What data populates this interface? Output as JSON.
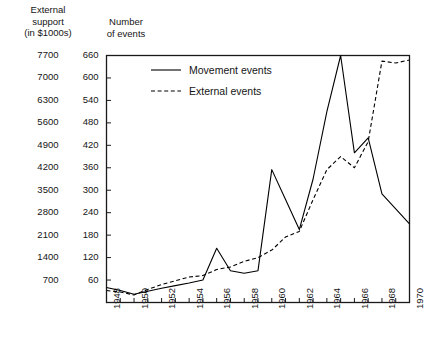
{
  "header": {
    "left_axis_title": "External support\n(in $1000s)",
    "left_axis_title_lines": [
      "External",
      "support",
      "(in $1000s)"
    ],
    "right_axis_title_lines": [
      "Number",
      "of events"
    ]
  },
  "chart_data": {
    "type": "line",
    "title": "",
    "xlabel": "",
    "ylabel": "Number of events",
    "y2label": "External support (in $1000s)",
    "grid": false,
    "legend_position": "top-left-inside",
    "xlim": [
      1948,
      1970
    ],
    "ylim": [
      0,
      660
    ],
    "y2lim": [
      0,
      7700
    ],
    "x": [
      1948,
      1949,
      1950,
      1951,
      1952,
      1953,
      1954,
      1955,
      1956,
      1957,
      1958,
      1959,
      1960,
      1961,
      1962,
      1963,
      1964,
      1965,
      1966,
      1967,
      1968,
      1969,
      1970
    ],
    "xticks": [
      1948,
      1949,
      1950,
      1951,
      1952,
      1953,
      1954,
      1955,
      1956,
      1957,
      1958,
      1959,
      1960,
      1961,
      1962,
      1963,
      1964,
      1965,
      1966,
      1967,
      1968,
      1969,
      1970
    ],
    "xticklabels": [
      "1948",
      "",
      "1950",
      "",
      "1952",
      "",
      "1954",
      "",
      "1956",
      "",
      "1958",
      "",
      "1960",
      "",
      "1962",
      "",
      "1964",
      "",
      "1966",
      "",
      "1968",
      "",
      "1970"
    ],
    "yticks": [
      60,
      120,
      180,
      240,
      300,
      360,
      420,
      480,
      540,
      600,
      660
    ],
    "yticklabels": [
      "60",
      "120",
      "180",
      "240",
      "300",
      "360",
      "420",
      "480",
      "540",
      "600",
      "660"
    ],
    "y2ticks": [
      700,
      1400,
      2100,
      2800,
      3500,
      4200,
      4900,
      5600,
      6300,
      7000,
      7700
    ],
    "y2ticklabels": [
      "700",
      "1400",
      "2100",
      "2800",
      "3500",
      "4200",
      "4900",
      "5600",
      "6300",
      "7000",
      "7700"
    ],
    "series": [
      {
        "name": "Movement events",
        "style": "solid",
        "color": "#000000",
        "values": [
          40,
          32,
          22,
          30,
          38,
          45,
          52,
          60,
          145,
          85,
          78,
          85,
          355,
          275,
          195,
          330,
          510,
          660,
          400,
          440,
          290,
          250,
          210
        ]
      },
      {
        "name": "External events",
        "style": "dashed",
        "color": "#000000",
        "values": [
          32,
          28,
          20,
          35,
          48,
          58,
          68,
          72,
          88,
          95,
          110,
          120,
          140,
          175,
          190,
          275,
          355,
          390,
          360,
          430,
          645,
          640,
          648
        ]
      }
    ]
  },
  "legend": {
    "items": [
      {
        "label": "Movement events",
        "style": "solid"
      },
      {
        "label": "External events",
        "style": "dashed"
      }
    ]
  }
}
